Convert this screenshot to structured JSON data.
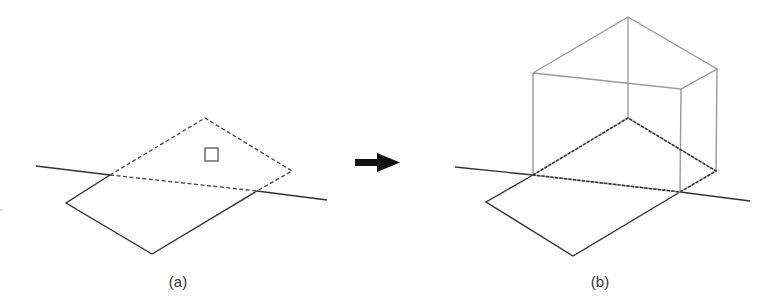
{
  "figure": {
    "panels": [
      {
        "id": "a",
        "label": "(a)",
        "description": "Flat rectangular footprint on a ground line with a dashed rear half and a small square marker",
        "horizon_line": [
          [
            36,
            166
          ],
          [
            327,
            200
          ]
        ],
        "solid_outline": [
          [
            110,
            175
          ],
          [
            66,
            203
          ],
          [
            152,
            254
          ],
          [
            257,
            191
          ]
        ],
        "dashed_outline": [
          [
            110,
            175
          ],
          [
            205,
            118
          ],
          [
            292,
            171
          ],
          [
            257,
            191
          ]
        ],
        "dashed_diagonal": [
          [
            110,
            175
          ],
          [
            257,
            191
          ]
        ],
        "marker_square": {
          "x": 205,
          "y": 148,
          "size": 13
        }
      },
      {
        "id": "b",
        "label": "(b)",
        "description": "Same footprint extruded into a box (prism) standing on the dashed base",
        "horizon_line": [
          [
            455,
            167
          ],
          [
            750,
            201
          ]
        ],
        "solid_outline": [
          [
            533,
            175
          ],
          [
            486,
            202
          ],
          [
            573,
            256
          ],
          [
            680,
            192
          ]
        ],
        "base_dashed": [
          [
            533,
            175
          ],
          [
            628,
            118
          ],
          [
            716,
            171
          ],
          [
            680,
            192
          ],
          [
            533,
            175
          ]
        ],
        "box_top": [
          [
            533,
            73
          ],
          [
            628,
            17
          ],
          [
            717,
            69
          ],
          [
            681,
            89
          ],
          [
            533,
            73
          ]
        ],
        "box_verticals": [
          [
            [
              533,
              73
            ],
            [
              533,
              175
            ]
          ],
          [
            [
              628,
              17
            ],
            [
              628,
              118
            ]
          ],
          [
            [
              717,
              69
            ],
            [
              716,
              171
            ]
          ],
          [
            [
              681,
              89
            ],
            [
              680,
              192
            ]
          ]
        ]
      }
    ],
    "arrow": {
      "from": [
        355,
        162
      ],
      "to": [
        400,
        162
      ],
      "direction": "right"
    },
    "colors": {
      "ground": "#333333",
      "box": "#9a9a9a",
      "background": "#ffffff"
    }
  }
}
